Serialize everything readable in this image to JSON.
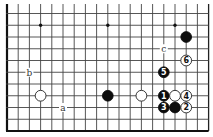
{
  "diagram": {
    "type": "go-board-fragment",
    "board_size": 19,
    "visible_rows": [
      8,
      18
    ],
    "visible_cols": [
      0,
      18
    ],
    "edges": [
      "left",
      "right",
      "bottom"
    ],
    "colors": {
      "line": "#444444",
      "black_stone": "#0d0d0d",
      "white_stone": "#ffffff",
      "background": "#ffffff"
    },
    "star_points": [
      {
        "col": 3,
        "row": 9
      },
      {
        "col": 9,
        "row": 9
      },
      {
        "col": 15,
        "row": 9
      }
    ],
    "stones": [
      {
        "color": "black",
        "col": 16,
        "row": 10,
        "label": ""
      },
      {
        "color": "white",
        "col": 16,
        "row": 12,
        "label": "6"
      },
      {
        "color": "black",
        "col": 14,
        "row": 13,
        "label": "5"
      },
      {
        "color": "white",
        "col": 3,
        "row": 15,
        "label": ""
      },
      {
        "color": "black",
        "col": 9,
        "row": 15,
        "label": ""
      },
      {
        "color": "white",
        "col": 12,
        "row": 15,
        "label": ""
      },
      {
        "color": "black",
        "col": 14,
        "row": 15,
        "label": "1"
      },
      {
        "color": "white",
        "col": 15,
        "row": 15,
        "label": ""
      },
      {
        "color": "white",
        "col": 16,
        "row": 15,
        "label": "4"
      },
      {
        "color": "black",
        "col": 14,
        "row": 16,
        "label": "3"
      },
      {
        "color": "black",
        "col": 15,
        "row": 16,
        "label": ""
      },
      {
        "color": "white",
        "col": 16,
        "row": 16,
        "label": "2"
      }
    ],
    "point_labels": [
      {
        "text": "a",
        "col": 5,
        "row": 16
      },
      {
        "text": "b",
        "col": 2,
        "row": 13
      },
      {
        "text": "c",
        "col": 14,
        "row": 11
      }
    ]
  }
}
